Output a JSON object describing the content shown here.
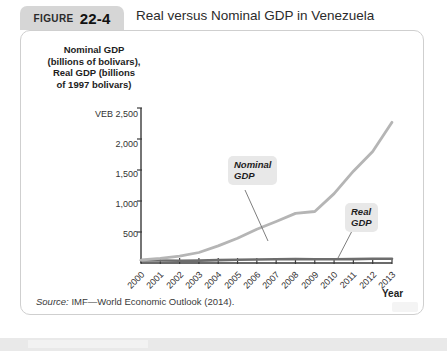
{
  "header": {
    "figure_word": "FIGURE",
    "figure_number": "22-4",
    "title": "Real versus Nominal GDP in Venezuela"
  },
  "source_note": {
    "prefix": "Source:",
    "text": " IMF—World Economic Outlook (2014)."
  },
  "colors": {
    "nominal_line": "#b5b5b5",
    "real_line": "#6d6d6d",
    "axis": "#3a3a3a",
    "label_box": "#e8e8e8",
    "tab": "#d6d6d6",
    "panel_border": "#cfcfcf"
  },
  "chart_data": {
    "type": "line",
    "title": "Real versus Nominal GDP in Venezuela",
    "xlabel": "Year",
    "ylabel": "Nominal GDP (billions of bolivars), Real GDP (billions of 1997 bolivars)",
    "ylabel_lines": [
      "Nominal GDP",
      "(billions of bolivars),",
      "Real GDP (billions",
      "of 1997 bolivars)"
    ],
    "currency_prefix": "VEB",
    "ylim": [
      0,
      2500
    ],
    "ytick_labels": [
      "VEB 2,500",
      "2,000",
      "1,500",
      "1,000",
      "500"
    ],
    "ytick_values": [
      2500,
      2000,
      1500,
      1000,
      500
    ],
    "grid": false,
    "legend": "annotations",
    "categories": [
      "2000",
      "2001",
      "2002",
      "2003",
      "2004",
      "2005",
      "2006",
      "2007",
      "2008",
      "2009",
      "2010",
      "2011",
      "2012",
      "2013"
    ],
    "x": [
      2000,
      2001,
      2002,
      2003,
      2004,
      2005,
      2006,
      2007,
      2008,
      2009,
      2010,
      2011,
      2012,
      2013
    ],
    "series": [
      {
        "name": "Nominal GDP",
        "label": "Nominal\nGDP",
        "label_line1": "Nominal",
        "label_line2": "GDP",
        "values": [
          48,
          75,
          110,
          170,
          275,
          400,
          545,
          670,
          800,
          830,
          1120,
          1480,
          1800,
          2270
        ]
      },
      {
        "name": "Real GDP",
        "label": "Real\nGDP",
        "label_line1": "Real",
        "label_line2": "GDP",
        "values": [
          42,
          40,
          36,
          39,
          46,
          51,
          56,
          60,
          63,
          61,
          60,
          63,
          67,
          68
        ]
      }
    ],
    "annotations": [
      {
        "text": "Nominal GDP",
        "target_year": 2006
      },
      {
        "text": "Real GDP",
        "target_year": 2011
      }
    ]
  }
}
